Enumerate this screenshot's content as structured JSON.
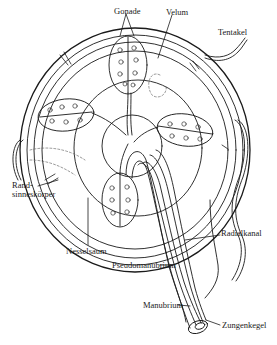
{
  "diagram": {
    "colors": {
      "ink": "#1a1a1a",
      "background": "#ffffff",
      "dashed": "#555555"
    },
    "labels": [
      {
        "id": "gonade",
        "text": "Gonade",
        "x": 114,
        "y": 11
      },
      {
        "id": "velum",
        "text": "Velum",
        "x": 165,
        "y": 12
      },
      {
        "id": "tentakel",
        "text": "Tentakel",
        "x": 218,
        "y": 27
      },
      {
        "id": "rand_line1",
        "text": "Rand-",
        "x": 12,
        "y": 185
      },
      {
        "id": "rand_line2",
        "text": "sinneskörper",
        "x": 12,
        "y": 194
      },
      {
        "id": "nesselsaum",
        "text": "Nesselsaum",
        "x": 66,
        "y": 247
      },
      {
        "id": "radialkanal",
        "text": "Radialkanal",
        "x": 221,
        "y": 232
      },
      {
        "id": "pseudomanubrium",
        "text": "Pseudomanubrium",
        "x": 112,
        "y": 263
      },
      {
        "id": "manubrium",
        "text": "Manubrium",
        "x": 143,
        "y": 303
      },
      {
        "id": "zungenkegel",
        "text": "Zungenkegel",
        "x": 222,
        "y": 323
      }
    ]
  }
}
